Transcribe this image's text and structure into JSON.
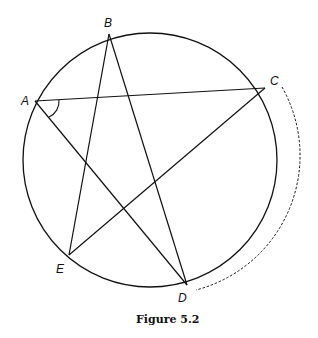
{
  "figure": {
    "caption": "Figure 5.2",
    "circle": {
      "cx": 150,
      "cy": 160,
      "r": 127
    },
    "points": {
      "A": {
        "label": "A",
        "x": 35,
        "y": 101
      },
      "B": {
        "label": "B",
        "x": 109,
        "y": 34
      },
      "C": {
        "label": "C",
        "x": 265,
        "y": 88
      },
      "D": {
        "label": "D",
        "x": 187,
        "y": 285
      },
      "E": {
        "label": "E",
        "x": 69,
        "y": 255
      }
    },
    "segments": [
      "AC",
      "AD",
      "BE",
      "BD",
      "EC"
    ],
    "angle_marked": "CAD",
    "dashed_arc": "C to D (outside circle)"
  }
}
